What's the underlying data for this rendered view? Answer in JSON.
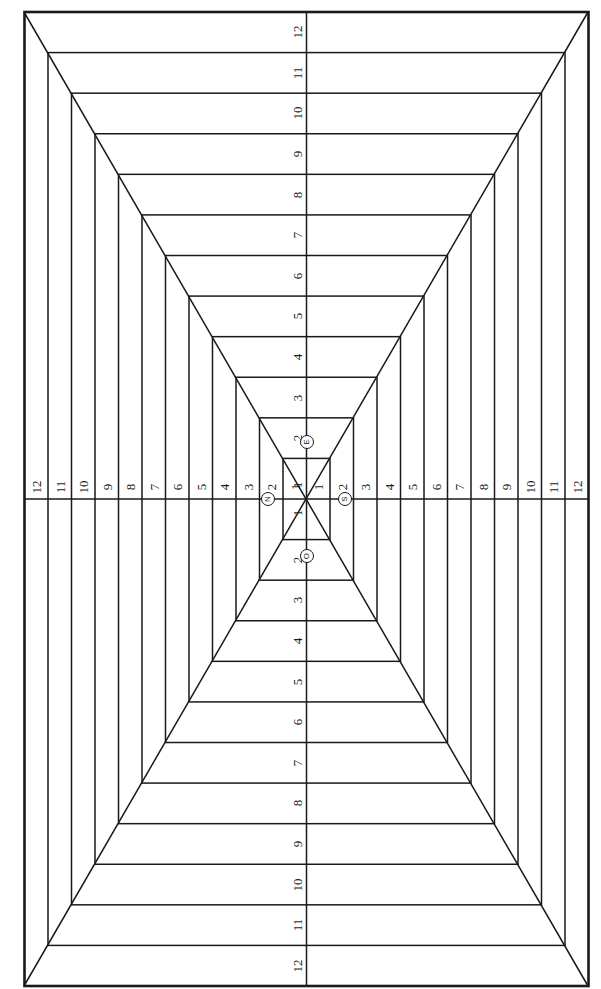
{
  "diagram": {
    "ring_count": 12,
    "line_color": "#1a1a1a",
    "background": "#ffffff",
    "axis_labels": {
      "top": [
        "1",
        "2",
        "3",
        "4",
        "5",
        "6",
        "7",
        "8",
        "9",
        "10",
        "11",
        "12"
      ],
      "bottom": [
        "1",
        "2",
        "3",
        "4",
        "5",
        "6",
        "7",
        "8",
        "9",
        "10",
        "11",
        "12"
      ],
      "left": [
        "1",
        "2",
        "3",
        "4",
        "5",
        "6",
        "7",
        "8",
        "9",
        "10",
        "11",
        "12"
      ],
      "right": [
        "1",
        "2",
        "3",
        "4",
        "5",
        "6",
        "7",
        "8",
        "9",
        "10",
        "11",
        "12"
      ]
    },
    "compass": {
      "north": "N",
      "south": "S",
      "east": "E",
      "west": "O"
    }
  }
}
